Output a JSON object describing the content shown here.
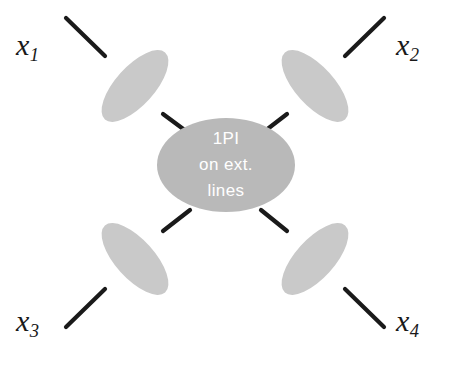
{
  "figure": {
    "background_color": "#ffffff",
    "width": 450,
    "height": 370
  },
  "central_blob": {
    "name": "central-1pi-blob",
    "shape": "ellipse",
    "fill_color": "#b9b9b9",
    "center": {
      "x": 226,
      "y": 165
    },
    "radius": {
      "x": 69,
      "y": 47
    },
    "text_color": "#ffffff",
    "lines": [
      "1PI",
      "on ext.",
      "lines"
    ]
  },
  "leg_blobs": [
    {
      "name": "leg-blob-upper-left",
      "fill_color": "#c9c9c9",
      "center": {
        "x": 135,
        "y": 86
      },
      "radius": {
        "x": 19,
        "y": 44
      },
      "rotation_deg": 42
    },
    {
      "name": "leg-blob-upper-right",
      "fill_color": "#c9c9c9",
      "center": {
        "x": 314,
        "y": 86
      },
      "radius": {
        "x": 19,
        "y": 44
      },
      "rotation_deg": -42
    },
    {
      "name": "leg-blob-lower-left",
      "fill_color": "#c9c9c9",
      "center": {
        "x": 135,
        "y": 259
      },
      "radius": {
        "x": 19,
        "y": 44
      },
      "rotation_deg": -42
    },
    {
      "name": "leg-blob-lower-right",
      "fill_color": "#c9c9c9",
      "center": {
        "x": 314,
        "y": 259
      },
      "radius": {
        "x": 19,
        "y": 44
      },
      "rotation_deg": 42
    }
  ],
  "lines": {
    "color": "#1a1a1a",
    "width": 4,
    "segments": [
      {
        "name": "external-line-x1",
        "x1": 66,
        "y1": 18,
        "x2": 105,
        "y2": 56
      },
      {
        "name": "external-line-x2",
        "x1": 384,
        "y1": 18,
        "x2": 345,
        "y2": 56
      },
      {
        "name": "external-line-x3",
        "x1": 66,
        "y1": 327,
        "x2": 105,
        "y2": 289
      },
      {
        "name": "external-line-x4",
        "x1": 384,
        "y1": 327,
        "x2": 345,
        "y2": 289
      },
      {
        "name": "internal-line-x1",
        "x1": 165,
        "y1": 116,
        "x2": 189,
        "y2": 133
      },
      {
        "name": "internal-line-x2",
        "x1": 285,
        "y1": 116,
        "x2": 262,
        "y2": 133
      },
      {
        "name": "internal-line-x3",
        "x1": 165,
        "y1": 229,
        "x2": 189,
        "y2": 210
      },
      {
        "name": "internal-line-x4",
        "x1": 285,
        "y1": 229,
        "x2": 262,
        "y2": 210
      }
    ]
  },
  "corner_labels": [
    {
      "name": "label-x1",
      "symbol": "x",
      "subscript": "1",
      "text": "x1",
      "position": "top-left"
    },
    {
      "name": "label-x2",
      "symbol": "x",
      "subscript": "2",
      "text": "x2",
      "position": "top-right"
    },
    {
      "name": "label-x3",
      "symbol": "x",
      "subscript": "3",
      "text": "x3",
      "position": "bottom-left"
    },
    {
      "name": "label-x4",
      "symbol": "x",
      "subscript": "4",
      "text": "x4",
      "position": "bottom-right"
    }
  ]
}
